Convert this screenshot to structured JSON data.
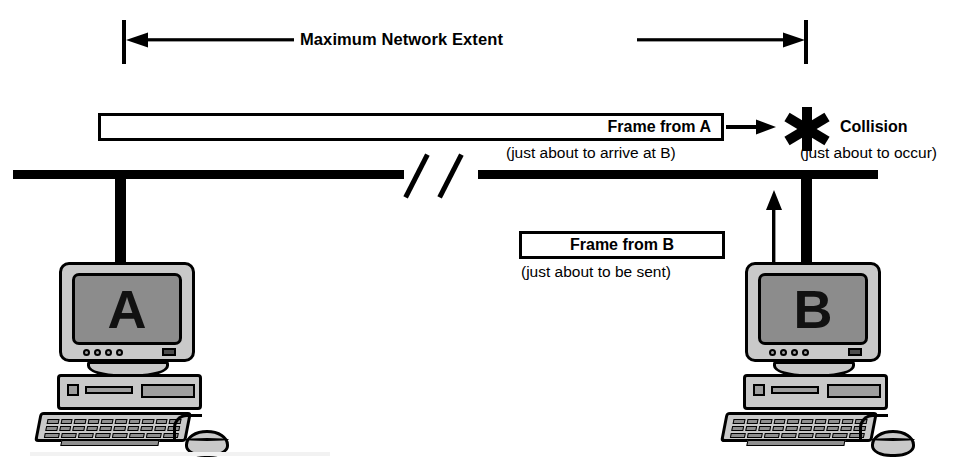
{
  "diagram": {
    "type": "network-bus-diagram",
    "background_color": "#ffffff",
    "ink_color": "#000000",
    "case_color": "#c9c9c9",
    "screen_color": "#8c8c8c"
  },
  "extent": {
    "label": "Maximum Network Extent",
    "left_arrow_icon": "arrow-left-icon",
    "right_arrow_icon": "arrow-right-icon",
    "left_tick_x": 122,
    "right_tick_x": 806
  },
  "frame_a": {
    "label": "Frame from A",
    "caption": "(just about to arrive at B)",
    "arrow_icon": "arrow-right-icon",
    "box_x": 98,
    "box_width": 626
  },
  "frame_b": {
    "label": "Frame from B",
    "caption": "(just about to be sent)",
    "arrow_icon": "arrow-up-icon",
    "box_x": 519,
    "box_width": 206
  },
  "collision": {
    "label": "Collision",
    "caption": "(just about to occur)",
    "icon": "asterisk-star-icon"
  },
  "bus": {
    "icon": "bus-cable-icon",
    "break_icon": "cable-break-icon",
    "start_x": 13,
    "end_x": 878,
    "y": 174
  },
  "computers": [
    {
      "name": "computer-a",
      "screen_letter": "A",
      "drop_cable_x": 120,
      "icon": "desktop-computer-icon"
    },
    {
      "name": "computer-b",
      "screen_letter": "B",
      "drop_cable_x": 806,
      "icon": "desktop-computer-icon"
    }
  ]
}
